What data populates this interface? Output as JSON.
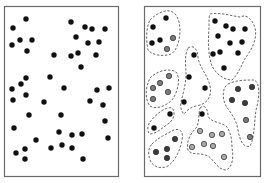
{
  "diagram": {
    "colors": {
      "background": "#ffffff",
      "border": "#6a6a6a",
      "dot_black": "#111111",
      "dot_dark_gray": "#3c3c3c",
      "dot_mid_gray": "#7a7a7a",
      "dot_light_gray": "#a8a8a8",
      "dot_outline": "#2a2a2a",
      "cluster_line": "#555555"
    },
    "left_panel": {
      "name": "unclustered-points",
      "frame": {
        "x": 4,
        "y": 6,
        "w": 114,
        "h": 170
      },
      "points": [
        [
          26,
          19
        ],
        [
          13,
          28
        ],
        [
          71,
          22
        ],
        [
          85,
          27
        ],
        [
          92,
          29
        ],
        [
          105,
          29
        ],
        [
          20,
          40
        ],
        [
          32,
          40
        ],
        [
          12,
          45
        ],
        [
          27,
          51
        ],
        [
          76,
          37
        ],
        [
          88,
          43
        ],
        [
          99,
          42
        ],
        [
          54,
          55
        ],
        [
          71,
          56
        ],
        [
          78,
          53
        ],
        [
          96,
          55
        ],
        [
          81,
          67
        ],
        [
          26,
          78
        ],
        [
          50,
          77
        ],
        [
          21,
          84
        ],
        [
          12,
          89
        ],
        [
          64,
          88
        ],
        [
          97,
          90
        ],
        [
          109,
          88
        ],
        [
          26,
          95
        ],
        [
          13,
          100
        ],
        [
          44,
          102
        ],
        [
          90,
          101
        ],
        [
          103,
          105
        ],
        [
          29,
          115
        ],
        [
          61,
          115
        ],
        [
          105,
          121
        ],
        [
          14,
          128
        ],
        [
          59,
          132
        ],
        [
          72,
          135
        ],
        [
          82,
          134
        ],
        [
          108,
          138
        ],
        [
          36,
          140
        ],
        [
          62,
          145
        ],
        [
          51,
          148
        ],
        [
          72,
          148
        ],
        [
          16,
          153
        ],
        [
          25,
          149
        ],
        [
          25,
          159
        ],
        [
          83,
          159
        ]
      ]
    },
    "right_panel": {
      "name": "clustered-points",
      "frame": {
        "x": 144,
        "y": 6,
        "w": 116,
        "h": 170
      },
      "clusters": [
        {
          "name": "cluster-top-left",
          "outline": "M150,20 C158,12 168,8 174,13 C180,18 181,30 179,40 C177,48 174,54 168,55 C160,56 152,55 148,50 C146,40 146,28 150,20 Z",
          "points": [
            {
              "x": 166,
              "y": 18,
              "tone": "black"
            },
            {
              "x": 153,
              "y": 27,
              "tone": "black"
            },
            {
              "x": 152,
              "y": 43,
              "tone": "black"
            },
            {
              "x": 160,
              "y": 40,
              "tone": "black"
            },
            {
              "x": 173,
              "y": 38,
              "tone": "mid_gray"
            },
            {
              "x": 167,
              "y": 49,
              "tone": "mid_gray"
            }
          ]
        },
        {
          "name": "cluster-top-right",
          "outline": "M210,14 C220,12 232,16 240,17 C246,14 252,18 255,28 C258,40 250,52 244,60 C240,70 236,76 232,80 C224,80 216,74 212,66 C208,56 208,40 209,28 C209,20 209,16 210,14 Z",
          "points": [
            {
              "x": 215,
              "y": 21,
              "tone": "black"
            },
            {
              "x": 226,
              "y": 26,
              "tone": "black"
            },
            {
              "x": 233,
              "y": 29,
              "tone": "black"
            },
            {
              "x": 245,
              "y": 29,
              "tone": "black"
            },
            {
              "x": 218,
              "y": 36,
              "tone": "black"
            },
            {
              "x": 230,
              "y": 43,
              "tone": "black"
            },
            {
              "x": 242,
              "y": 42,
              "tone": "black"
            },
            {
              "x": 213,
              "y": 54,
              "tone": "black"
            },
            {
              "x": 220,
              "y": 52,
              "tone": "black"
            },
            {
              "x": 238,
              "y": 53,
              "tone": "black"
            },
            {
              "x": 224,
              "y": 68,
              "tone": "black"
            }
          ]
        },
        {
          "name": "cluster-center-vertical",
          "outline": "M188,48 C194,44 198,50 198,58 C200,68 208,76 210,86 C212,96 208,104 196,106 C188,108 186,112 184,114 C180,110 180,104 182,98 C184,90 186,82 186,74 C186,66 184,56 188,48 Z",
          "points": [
            {
              "x": 194,
              "y": 55,
              "tone": "black"
            },
            {
              "x": 189,
              "y": 77,
              "tone": "black"
            },
            {
              "x": 205,
              "y": 88,
              "tone": "black"
            },
            {
              "x": 184,
              "y": 102,
              "tone": "black"
            }
          ]
        },
        {
          "name": "cluster-mid-left",
          "outline": "M150,78 C158,70 170,68 176,72 C181,78 178,92 172,100 C166,106 156,110 150,106 C145,100 145,88 150,78 Z",
          "points": [
            {
              "x": 169,
              "y": 76,
              "tone": "mid_gray"
            },
            {
              "x": 160,
              "y": 83,
              "tone": "mid_gray"
            },
            {
              "x": 153,
              "y": 88,
              "tone": "mid_gray"
            },
            {
              "x": 168,
              "y": 92,
              "tone": "mid_gray"
            },
            {
              "x": 153,
              "y": 99,
              "tone": "mid_gray"
            }
          ]
        },
        {
          "name": "cluster-mid-right",
          "outline": "M228,84 C236,80 246,80 254,80 C260,82 260,96 256,110 C254,126 254,140 250,146 C244,148 240,142 238,130 C236,118 230,112 226,106 C222,98 222,88 228,84 Z",
          "points": [
            {
              "x": 238,
              "y": 89,
              "tone": "dark_gray"
            },
            {
              "x": 252,
              "y": 87,
              "tone": "dark_gray"
            },
            {
              "x": 232,
              "y": 100,
              "tone": "dark_gray"
            },
            {
              "x": 245,
              "y": 103,
              "tone": "dark_gray"
            },
            {
              "x": 246,
              "y": 120,
              "tone": "mid_gray"
            },
            {
              "x": 250,
              "y": 137,
              "tone": "mid_gray"
            }
          ]
        },
        {
          "name": "cluster-small-left",
          "outline": "M150,122 C156,114 166,106 172,108 C176,112 174,120 168,124 C162,128 156,134 150,134 C147,132 147,126 150,122 Z",
          "points": [
            {
              "x": 170,
              "y": 114,
              "tone": "black"
            },
            {
              "x": 154,
              "y": 128,
              "tone": "black"
            }
          ]
        },
        {
          "name": "cluster-bottom-left",
          "outline": "M152,144 C158,138 166,134 174,130 C180,128 184,132 182,140 C180,150 176,160 168,166 C160,170 152,166 150,160 C148,154 148,148 152,144 Z",
          "points": [
            {
              "x": 175,
              "y": 139,
              "tone": "dark_gray"
            },
            {
              "x": 156,
              "y": 152,
              "tone": "dark_gray"
            },
            {
              "x": 167,
              "y": 149,
              "tone": "dark_gray"
            },
            {
              "x": 167,
              "y": 158,
              "tone": "dark_gray"
            }
          ]
        },
        {
          "name": "cluster-bottom-center",
          "outline": "M200,108 C204,104 208,108 208,116 C210,122 220,122 226,126 C230,130 232,138 232,148 C234,158 232,168 226,170 C218,170 214,160 208,156 C200,152 192,156 188,150 C186,142 190,134 196,128 C200,122 198,114 200,108 Z",
          "points": [
            {
              "x": 202,
              "y": 114,
              "tone": "black"
            },
            {
              "x": 200,
              "y": 131,
              "tone": "light_gray"
            },
            {
              "x": 212,
              "y": 135,
              "tone": "light_gray"
            },
            {
              "x": 222,
              "y": 134,
              "tone": "light_gray"
            },
            {
              "x": 192,
              "y": 147,
              "tone": "light_gray"
            },
            {
              "x": 204,
              "y": 144,
              "tone": "light_gray"
            },
            {
              "x": 213,
              "y": 146,
              "tone": "light_gray"
            },
            {
              "x": 224,
              "y": 157,
              "tone": "light_gray"
            }
          ]
        }
      ]
    }
  }
}
